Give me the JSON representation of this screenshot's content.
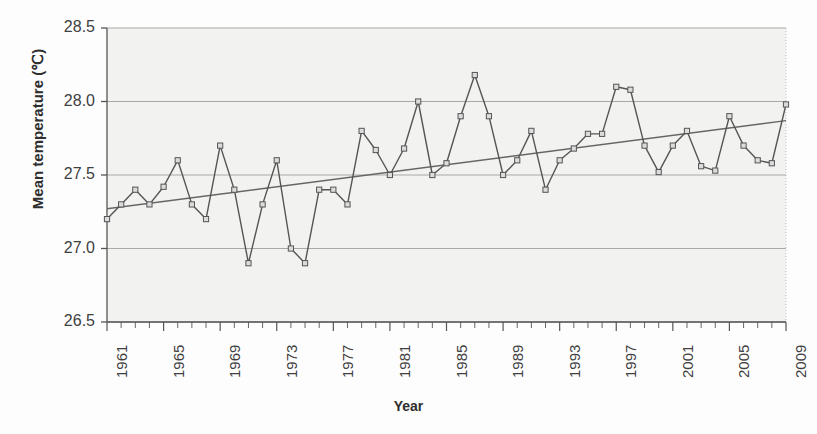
{
  "chart_data": {
    "type": "line",
    "title": "Temperature rise in Kerala since last  50  years ( 0.6 °C increase)",
    "xlabel": "Year",
    "ylabel": "Mean temperature (℃)",
    "ylim": [
      26.5,
      28.5
    ],
    "xlim": [
      1961,
      2009
    ],
    "ytick_labels": [
      "28.5",
      "28.0",
      "27.5",
      "27.0",
      "26.5"
    ],
    "ytick_values": [
      28.5,
      28.0,
      27.5,
      27.0,
      26.5
    ],
    "xtick_labels": [
      "1961",
      "1965",
      "1969",
      "1973",
      "1977",
      "1981",
      "1985",
      "1989",
      "1993",
      "1997",
      "2001",
      "2005",
      "2009"
    ],
    "xtick_values": [
      1961,
      1965,
      1969,
      1973,
      1977,
      1981,
      1985,
      1989,
      1993,
      1997,
      2001,
      2005,
      2009
    ],
    "grid": "horizontal",
    "legend": "none",
    "marker": "square",
    "series": [
      {
        "name": "Mean temperature",
        "x": [
          1961,
          1962,
          1963,
          1964,
          1965,
          1966,
          1967,
          1968,
          1969,
          1970,
          1971,
          1972,
          1973,
          1974,
          1975,
          1976,
          1977,
          1978,
          1979,
          1980,
          1981,
          1982,
          1983,
          1984,
          1985,
          1986,
          1987,
          1988,
          1989,
          1990,
          1991,
          1992,
          1993,
          1994,
          1995,
          1996,
          1997,
          1998,
          1999,
          2000,
          2001,
          2002,
          2003,
          2004,
          2005,
          2006,
          2007,
          2008,
          2009
        ],
        "values": [
          27.2,
          27.3,
          27.4,
          27.3,
          27.42,
          27.6,
          27.3,
          27.2,
          27.7,
          27.4,
          26.9,
          27.3,
          27.6,
          27.0,
          26.9,
          27.4,
          27.4,
          27.3,
          27.8,
          27.67,
          27.5,
          27.68,
          28.0,
          27.5,
          27.58,
          27.9,
          28.18,
          27.9,
          27.5,
          27.6,
          27.8,
          27.4,
          27.6,
          27.68,
          27.78,
          27.78,
          28.1,
          28.08,
          27.7,
          27.52,
          27.7,
          27.8,
          27.56,
          27.53,
          27.9,
          27.7,
          27.6,
          27.58,
          27.98
        ]
      },
      {
        "name": "Linear trend",
        "x": [
          1961,
          2009
        ],
        "values": [
          27.27,
          27.87
        ]
      }
    ]
  },
  "colors": {
    "line": "#555555",
    "trend": "#666666",
    "grid": "#a8a8a8",
    "axis": "#555555",
    "plot_background": "#f2f2f0",
    "text": "#3a3a3a"
  }
}
